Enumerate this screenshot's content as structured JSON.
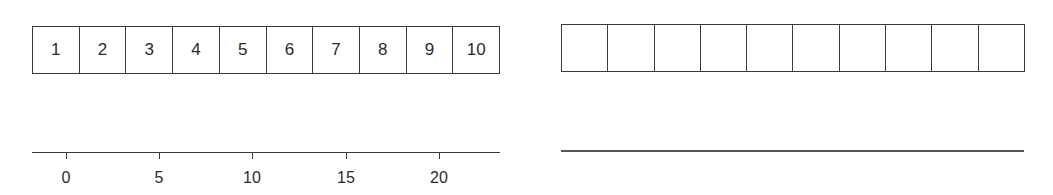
{
  "left_panel": {
    "cells": [
      "1",
      "2",
      "3",
      "4",
      "5",
      "6",
      "7",
      "8",
      "9",
      "10"
    ],
    "axis": {
      "ticks": [
        {
          "label": "0",
          "x": 34
        },
        {
          "label": "5",
          "x": 127
        },
        {
          "label": "10",
          "x": 220
        },
        {
          "label": "15",
          "x": 314
        },
        {
          "label": "20",
          "x": 407
        }
      ]
    }
  },
  "right_panel": {
    "cells": [
      "",
      "",
      "",
      "",
      "",
      "",
      "",
      "",
      "",
      ""
    ],
    "axis": {
      "ticks": []
    }
  },
  "colors": {
    "line": "#3a3a3a",
    "text": "#2a2a2a",
    "background": "#ffffff"
  }
}
